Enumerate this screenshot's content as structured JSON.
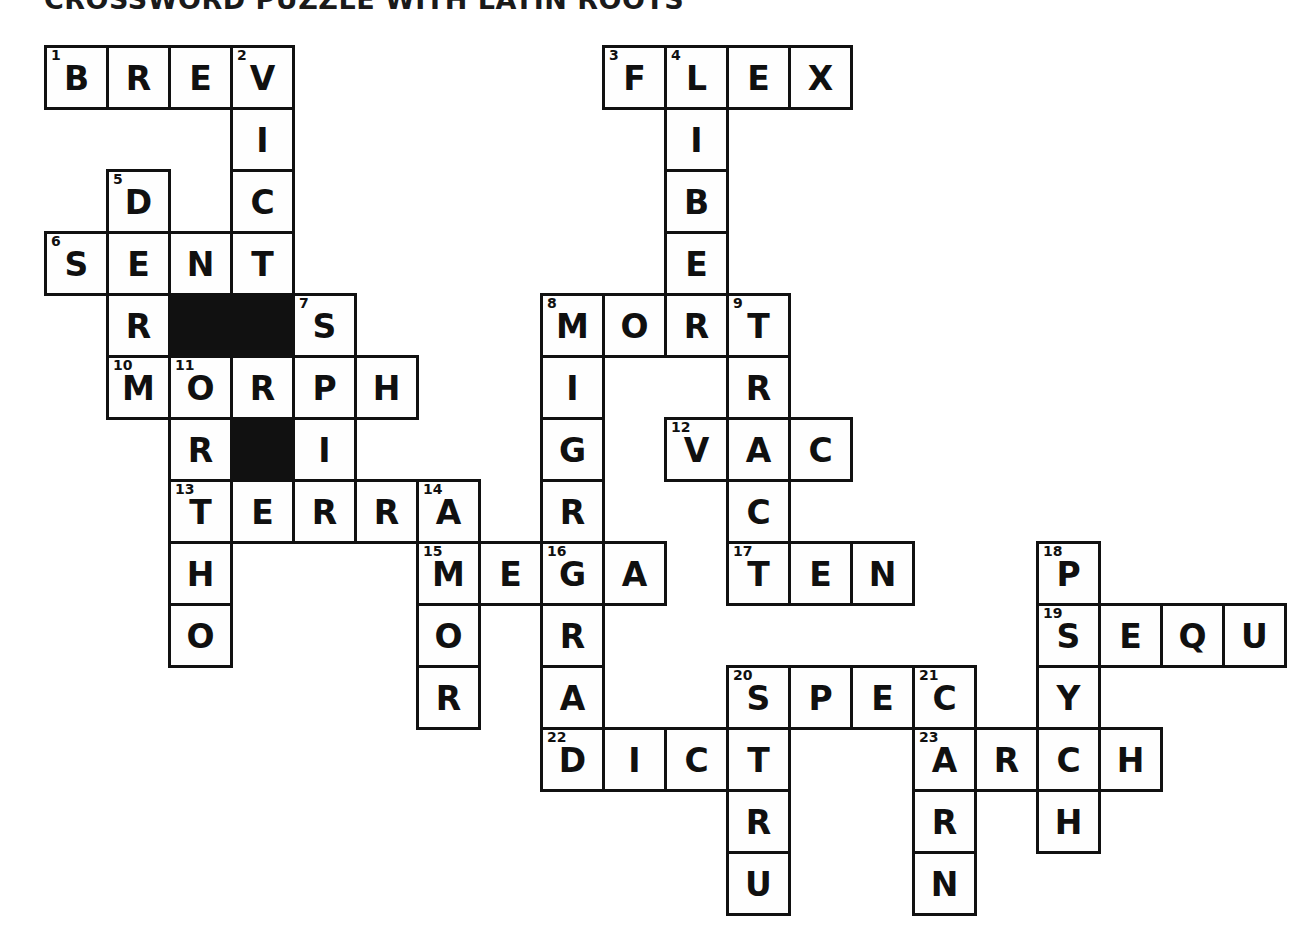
{
  "title": "CROSSWORD PUZZLE WITH LATIN ROOTS",
  "grid": {
    "cell_size": 62,
    "origin_x": 44,
    "origin_y": 45,
    "columns": 20,
    "rows": 14,
    "letter_color": "#101010",
    "cell_fill": "#fefefe",
    "block_fill": "#111111",
    "border_color": "#111111"
  },
  "cells": [
    {
      "r": 0,
      "c": 0,
      "letter": "B",
      "number": "1"
    },
    {
      "r": 0,
      "c": 1,
      "letter": "R",
      "number": ""
    },
    {
      "r": 0,
      "c": 2,
      "letter": "E",
      "number": ""
    },
    {
      "r": 0,
      "c": 3,
      "letter": "V",
      "number": "2"
    },
    {
      "r": 0,
      "c": 9,
      "letter": "F",
      "number": "3"
    },
    {
      "r": 0,
      "c": 10,
      "letter": "L",
      "number": "4"
    },
    {
      "r": 0,
      "c": 11,
      "letter": "E",
      "number": ""
    },
    {
      "r": 0,
      "c": 12,
      "letter": "X",
      "number": ""
    },
    {
      "r": 1,
      "c": 3,
      "letter": "I",
      "number": ""
    },
    {
      "r": 1,
      "c": 10,
      "letter": "I",
      "number": ""
    },
    {
      "r": 2,
      "c": 1,
      "letter": "D",
      "number": "5"
    },
    {
      "r": 2,
      "c": 3,
      "letter": "C",
      "number": ""
    },
    {
      "r": 2,
      "c": 10,
      "letter": "B",
      "number": ""
    },
    {
      "r": 3,
      "c": 0,
      "letter": "S",
      "number": "6"
    },
    {
      "r": 3,
      "c": 1,
      "letter": "E",
      "number": ""
    },
    {
      "r": 3,
      "c": 2,
      "letter": "N",
      "number": ""
    },
    {
      "r": 3,
      "c": 3,
      "letter": "T",
      "number": ""
    },
    {
      "r": 3,
      "c": 10,
      "letter": "E",
      "number": ""
    },
    {
      "r": 4,
      "c": 1,
      "letter": "R",
      "number": ""
    },
    {
      "r": 4,
      "c": 2,
      "letter": "",
      "number": "",
      "block": true
    },
    {
      "r": 4,
      "c": 3,
      "letter": "",
      "number": "",
      "block": true
    },
    {
      "r": 4,
      "c": 4,
      "letter": "S",
      "number": "7"
    },
    {
      "r": 4,
      "c": 8,
      "letter": "M",
      "number": "8"
    },
    {
      "r": 4,
      "c": 9,
      "letter": "O",
      "number": ""
    },
    {
      "r": 4,
      "c": 10,
      "letter": "R",
      "number": ""
    },
    {
      "r": 4,
      "c": 11,
      "letter": "T",
      "number": "9"
    },
    {
      "r": 5,
      "c": 1,
      "letter": "M",
      "number": "10"
    },
    {
      "r": 5,
      "c": 2,
      "letter": "O",
      "number": "11"
    },
    {
      "r": 5,
      "c": 3,
      "letter": "R",
      "number": ""
    },
    {
      "r": 5,
      "c": 4,
      "letter": "P",
      "number": ""
    },
    {
      "r": 5,
      "c": 5,
      "letter": "H",
      "number": ""
    },
    {
      "r": 5,
      "c": 8,
      "letter": "I",
      "number": ""
    },
    {
      "r": 5,
      "c": 11,
      "letter": "R",
      "number": ""
    },
    {
      "r": 6,
      "c": 2,
      "letter": "R",
      "number": ""
    },
    {
      "r": 6,
      "c": 3,
      "letter": "",
      "number": "",
      "block": true
    },
    {
      "r": 6,
      "c": 4,
      "letter": "I",
      "number": ""
    },
    {
      "r": 6,
      "c": 8,
      "letter": "G",
      "number": ""
    },
    {
      "r": 6,
      "c": 10,
      "letter": "V",
      "number": "12"
    },
    {
      "r": 6,
      "c": 11,
      "letter": "A",
      "number": ""
    },
    {
      "r": 6,
      "c": 12,
      "letter": "C",
      "number": ""
    },
    {
      "r": 7,
      "c": 2,
      "letter": "T",
      "number": "13"
    },
    {
      "r": 7,
      "c": 3,
      "letter": "E",
      "number": ""
    },
    {
      "r": 7,
      "c": 4,
      "letter": "R",
      "number": ""
    },
    {
      "r": 7,
      "c": 5,
      "letter": "R",
      "number": ""
    },
    {
      "r": 7,
      "c": 6,
      "letter": "A",
      "number": "14"
    },
    {
      "r": 7,
      "c": 8,
      "letter": "R",
      "number": ""
    },
    {
      "r": 7,
      "c": 11,
      "letter": "C",
      "number": ""
    },
    {
      "r": 8,
      "c": 2,
      "letter": "H",
      "number": ""
    },
    {
      "r": 8,
      "c": 6,
      "letter": "M",
      "number": "15"
    },
    {
      "r": 8,
      "c": 7,
      "letter": "E",
      "number": ""
    },
    {
      "r": 8,
      "c": 8,
      "letter": "G",
      "number": "16"
    },
    {
      "r": 8,
      "c": 9,
      "letter": "A",
      "number": ""
    },
    {
      "r": 8,
      "c": 11,
      "letter": "T",
      "number": "17"
    },
    {
      "r": 8,
      "c": 12,
      "letter": "E",
      "number": ""
    },
    {
      "r": 8,
      "c": 13,
      "letter": "N",
      "number": ""
    },
    {
      "r": 8,
      "c": 16,
      "letter": "P",
      "number": "18"
    },
    {
      "r": 9,
      "c": 2,
      "letter": "O",
      "number": ""
    },
    {
      "r": 9,
      "c": 6,
      "letter": "O",
      "number": ""
    },
    {
      "r": 9,
      "c": 8,
      "letter": "R",
      "number": ""
    },
    {
      "r": 9,
      "c": 16,
      "letter": "S",
      "number": "19"
    },
    {
      "r": 9,
      "c": 17,
      "letter": "E",
      "number": ""
    },
    {
      "r": 9,
      "c": 18,
      "letter": "Q",
      "number": ""
    },
    {
      "r": 9,
      "c": 19,
      "letter": "U",
      "number": ""
    },
    {
      "r": 10,
      "c": 6,
      "letter": "R",
      "number": ""
    },
    {
      "r": 10,
      "c": 8,
      "letter": "A",
      "number": ""
    },
    {
      "r": 10,
      "c": 11,
      "letter": "S",
      "number": "20"
    },
    {
      "r": 10,
      "c": 12,
      "letter": "P",
      "number": ""
    },
    {
      "r": 10,
      "c": 13,
      "letter": "E",
      "number": ""
    },
    {
      "r": 10,
      "c": 14,
      "letter": "C",
      "number": "21"
    },
    {
      "r": 10,
      "c": 16,
      "letter": "Y",
      "number": ""
    },
    {
      "r": 11,
      "c": 8,
      "letter": "D",
      "number": "22"
    },
    {
      "r": 11,
      "c": 9,
      "letter": "I",
      "number": ""
    },
    {
      "r": 11,
      "c": 10,
      "letter": "C",
      "number": ""
    },
    {
      "r": 11,
      "c": 11,
      "letter": "T",
      "number": ""
    },
    {
      "r": 11,
      "c": 14,
      "letter": "A",
      "number": "23"
    },
    {
      "r": 11,
      "c": 15,
      "letter": "R",
      "number": ""
    },
    {
      "r": 11,
      "c": 16,
      "letter": "C",
      "number": ""
    },
    {
      "r": 11,
      "c": 17,
      "letter": "H",
      "number": ""
    },
    {
      "r": 12,
      "c": 11,
      "letter": "R",
      "number": ""
    },
    {
      "r": 12,
      "c": 14,
      "letter": "R",
      "number": ""
    },
    {
      "r": 12,
      "c": 16,
      "letter": "H",
      "number": ""
    },
    {
      "r": 13,
      "c": 11,
      "letter": "U",
      "number": ""
    },
    {
      "r": 13,
      "c": 14,
      "letter": "N",
      "number": ""
    }
  ],
  "entries": {
    "across": [
      {
        "number": "1",
        "answer": "BREV"
      },
      {
        "number": "3",
        "answer": "FLEX"
      },
      {
        "number": "6",
        "answer": "SENT"
      },
      {
        "number": "8",
        "answer": "MORT"
      },
      {
        "number": "10",
        "answer": "MORPH"
      },
      {
        "number": "12",
        "answer": "VAC"
      },
      {
        "number": "13",
        "answer": "TERRA"
      },
      {
        "number": "15",
        "answer": "MEGA"
      },
      {
        "number": "17",
        "answer": "TEN"
      },
      {
        "number": "19",
        "answer": "SEQU"
      },
      {
        "number": "20",
        "answer": "SPEC"
      },
      {
        "number": "22",
        "answer": "DICT"
      },
      {
        "number": "23",
        "answer": "ARCH"
      }
    ],
    "down": [
      {
        "number": "2",
        "answer": "VICT"
      },
      {
        "number": "4",
        "answer": "LIBER"
      },
      {
        "number": "5",
        "answer": "DERM"
      },
      {
        "number": "7",
        "answer": "SPIRIT"
      },
      {
        "number": "8",
        "answer": "MIGRA"
      },
      {
        "number": "9",
        "answer": "TRACT"
      },
      {
        "number": "11",
        "answer": "ORT"
      },
      {
        "number": "13",
        "answer": "THO"
      },
      {
        "number": "14",
        "answer": "AMOR"
      },
      {
        "number": "16",
        "answer": "GRAD"
      },
      {
        "number": "18",
        "answer": "PSYCH"
      },
      {
        "number": "20",
        "answer": "STRU"
      },
      {
        "number": "21",
        "answer": "CARN"
      }
    ]
  }
}
